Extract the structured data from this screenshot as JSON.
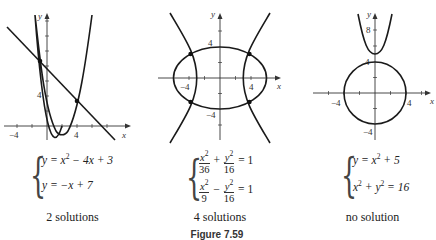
{
  "figure": {
    "caption": "Figure 7.59",
    "panels": [
      {
        "id": "graph-1",
        "axis_labels": {
          "x": "x",
          "y": "y"
        },
        "tick_labels": {
          "x_neg": "−4",
          "x_pos": "4",
          "y_pos": "4"
        },
        "system": [
          "y = x² − 4x + 3",
          "y = −x + 7"
        ],
        "system_parts": {
          "eq1": {
            "lhs": "y",
            "mid": " = x",
            "exp": "2",
            "rest": " − 4x + 3"
          },
          "eq2": {
            "text": "y = −x + 7"
          }
        },
        "result": "2 solutions",
        "intersections": [
          [
            -1,
            8
          ],
          [
            4,
            3
          ]
        ]
      },
      {
        "id": "graph-2",
        "axis_labels": {
          "x": "x",
          "y": "y"
        },
        "tick_labels": {
          "x_neg": "−4",
          "x_pos": "4",
          "y_pos": "4",
          "y_neg": "−4"
        },
        "system": [
          "x²/36 + y²/16 = 1",
          "x²/9 − y²/16 = 1"
        ],
        "system_parts": {
          "eq1": {
            "n1": "x",
            "e1": "2",
            "d1": "36",
            "op": "+",
            "n2": "y",
            "e2": "2",
            "d2": "16",
            "rhs": "= 1"
          },
          "eq2": {
            "n1": "x",
            "e1": "2",
            "d1": "9",
            "op": "−",
            "n2": "y",
            "e2": "2",
            "d2": "16",
            "rhs": "= 1"
          }
        },
        "result": "4 solutions",
        "intersections": [
          [
            -3.79,
            3.1
          ],
          [
            3.79,
            3.1
          ],
          [
            -3.79,
            -3.1
          ],
          [
            3.79,
            -3.1
          ]
        ]
      },
      {
        "id": "graph-3",
        "axis_labels": {
          "x": "x",
          "y": "y"
        },
        "tick_labels": {
          "x_neg": "−4",
          "x_pos": "4",
          "y_pos": "4",
          "y_neg": "−4",
          "y_top": "8"
        },
        "system": [
          "y = x² + 5",
          "x² + y² = 16"
        ],
        "system_parts": {
          "eq1": {
            "lhs": "y",
            "mid": " = x",
            "exp": "2",
            "rest": " + 5"
          },
          "eq2": {
            "a": "x",
            "ea": "2",
            "op": " + ",
            "b": "y",
            "eb": "2",
            "rest": " = 16"
          }
        },
        "result": "no solution",
        "intersections": []
      }
    ]
  }
}
